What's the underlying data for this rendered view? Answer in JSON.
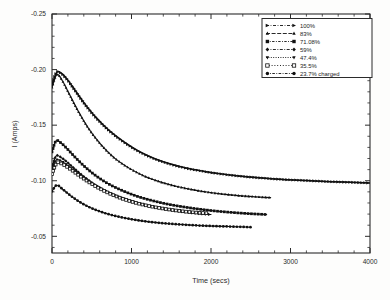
{
  "figure": {
    "background": "#fdfdfc",
    "ink_color": "#111111"
  },
  "chart_data": {
    "type": "line",
    "title": "",
    "xlabel": "Time (secs)",
    "ylabel": "I (Amps)",
    "xlim": [
      0,
      4000
    ],
    "ylim": [
      -0.25,
      -0.035
    ],
    "y_inverted": true,
    "grid": false,
    "legend_position": "top-right",
    "xticks": [
      0,
      1000,
      2000,
      3000,
      4000
    ],
    "xtick_labels": [
      "0",
      "1000",
      "2000",
      "3000",
      "4000"
    ],
    "yticks": [
      -0.25,
      -0.2,
      -0.15,
      -0.1,
      -0.05
    ],
    "ytick_labels": [
      "-0.25",
      "-0.20",
      "-0.15",
      "-0.10",
      "-0.05"
    ],
    "x_minor_tick_step": 200,
    "y_minor_tick_step": 0.01,
    "series": [
      {
        "name": "100%",
        "marker": "arrow-right",
        "line": "dash-dot",
        "x": [
          0,
          60,
          120,
          200,
          300,
          420,
          560,
          720,
          900,
          1100,
          1300,
          1500,
          1700,
          1900,
          2100,
          2350,
          2600,
          2900,
          3200,
          3500,
          3750,
          4000
        ],
        "y": [
          -0.186,
          -0.1975,
          -0.1965,
          -0.1905,
          -0.1805,
          -0.1685,
          -0.1565,
          -0.1452,
          -0.1352,
          -0.1262,
          -0.1196,
          -0.1148,
          -0.1112,
          -0.1086,
          -0.1064,
          -0.1043,
          -0.1027,
          -0.1012,
          -0.1002,
          -0.0992,
          -0.0986,
          -0.098
        ]
      },
      {
        "name": "83%",
        "marker": "triangle-up",
        "line": "dashed",
        "x": [
          0,
          60,
          130,
          220,
          330,
          460,
          610,
          780,
          960,
          1150,
          1350,
          1550,
          1750,
          1950,
          2150,
          2350,
          2550,
          2750
        ],
        "y": [
          -0.184,
          -0.1955,
          -0.19,
          -0.1775,
          -0.1625,
          -0.147,
          -0.133,
          -0.1208,
          -0.1118,
          -0.1046,
          -0.0992,
          -0.0952,
          -0.0922,
          -0.0898,
          -0.088,
          -0.0866,
          -0.0856,
          -0.0848
        ]
      },
      {
        "name": "71.08%",
        "marker": "square-filled",
        "line": "dash-dot-dot",
        "x": [
          0,
          50,
          110,
          190,
          290,
          410,
          550,
          710,
          890,
          1080,
          1280,
          1480,
          1680,
          1880,
          2080,
          2280,
          2480,
          2700
        ],
        "y": [
          -0.126,
          -0.1358,
          -0.1342,
          -0.1288,
          -0.1212,
          -0.1128,
          -0.1046,
          -0.0972,
          -0.091,
          -0.0858,
          -0.0818,
          -0.0786,
          -0.0762,
          -0.0742,
          -0.0726,
          -0.0714,
          -0.0704,
          -0.0696
        ]
      },
      {
        "name": "59%",
        "marker": "diamond-filled",
        "line": "dash-dot",
        "x": [
          0,
          50,
          110,
          190,
          290,
          410,
          550,
          710,
          890,
          1080,
          1280,
          1480,
          1680,
          1880,
          2000
        ],
        "y": [
          -0.112,
          -0.1222,
          -0.1212,
          -0.1168,
          -0.1104,
          -0.1032,
          -0.096,
          -0.0896,
          -0.0842,
          -0.0798,
          -0.0764,
          -0.0738,
          -0.0718,
          -0.0702,
          -0.0696
        ]
      },
      {
        "name": "47.4%",
        "marker": "triangle-down",
        "line": "dotted",
        "x": [
          0,
          50,
          110,
          190,
          290,
          410,
          550,
          710,
          890,
          1080,
          1280,
          1480,
          1680,
          1880,
          1950
        ],
        "y": [
          -0.108,
          -0.1185,
          -0.118,
          -0.1142,
          -0.1084,
          -0.1018,
          -0.0952,
          -0.0892,
          -0.0842,
          -0.08,
          -0.0768,
          -0.0744,
          -0.0724,
          -0.071,
          -0.0706
        ]
      },
      {
        "name": "35.5%",
        "marker": "square-open",
        "line": "dotted-long",
        "x": [
          0,
          60,
          130,
          220,
          340,
          480,
          640,
          820,
          1010,
          1210,
          1410,
          1610,
          1810,
          1960
        ],
        "y": [
          -0.106,
          -0.116,
          -0.115,
          -0.111,
          -0.1048,
          -0.098,
          -0.0914,
          -0.0856,
          -0.081,
          -0.0774,
          -0.0748,
          -0.0728,
          -0.0714,
          -0.0708
        ]
      },
      {
        "name": "23.7% charged",
        "marker": "circle-filled",
        "line": "dash-dot",
        "x": [
          0,
          60,
          140,
          240,
          360,
          500,
          660,
          840,
          1030,
          1230,
          1430,
          1630,
          1830,
          2030,
          2230,
          2430,
          2500
        ],
        "y": [
          -0.0905,
          -0.096,
          -0.092,
          -0.0862,
          -0.0804,
          -0.0752,
          -0.071,
          -0.0676,
          -0.065,
          -0.063,
          -0.0616,
          -0.0606,
          -0.0598,
          -0.0592,
          -0.0588,
          -0.0584,
          -0.0582
        ]
      }
    ]
  },
  "legend": {
    "entries": [
      {
        "label": "100%"
      },
      {
        "label": "83%"
      },
      {
        "label": "71.08%"
      },
      {
        "label": "59%"
      },
      {
        "label": "47.4%"
      },
      {
        "label": "35.5%"
      },
      {
        "label": "23.7% charged"
      }
    ]
  }
}
